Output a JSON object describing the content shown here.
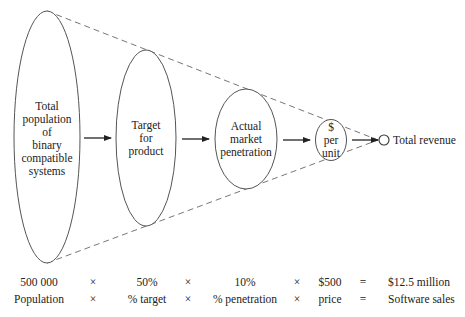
{
  "diagram": {
    "stages": [
      {
        "id": "total-population",
        "lines": [
          "Total",
          "population",
          "of",
          "binary",
          "compatible",
          "systems"
        ]
      },
      {
        "id": "target-for-product",
        "lines": [
          "Target",
          "for",
          "product"
        ]
      },
      {
        "id": "actual-market-penetration",
        "lines": [
          "Actual",
          "market",
          "penetration"
        ]
      },
      {
        "id": "dollars-per-unit",
        "lines": [
          "$",
          "per",
          "unit"
        ]
      }
    ],
    "end_label": "Total revenue"
  },
  "equation": {
    "values": [
      "500 000",
      "×",
      "50%",
      "×",
      "10%",
      "×",
      "$500",
      "=",
      "$12.5 million"
    ],
    "labels": [
      "Population",
      "×",
      "% target",
      "×",
      "% penetration",
      "×",
      "price",
      "=",
      "Software sales"
    ]
  },
  "colors": {
    "stroke": "#555555",
    "dash": "#666666",
    "text": "#222222"
  }
}
